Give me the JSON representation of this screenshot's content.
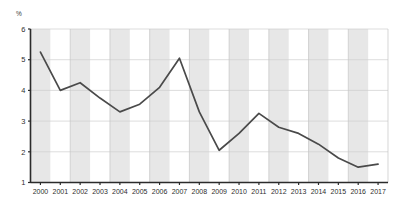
{
  "chart_data": {
    "type": "line",
    "title": "",
    "subtitle": "",
    "xlabel": "",
    "ylabel": "",
    "unit_label": "%",
    "categories": [
      "2000",
      "2001",
      "2002",
      "2003",
      "2004",
      "2005",
      "2006",
      "2007",
      "2008",
      "2009",
      "2010",
      "2011",
      "2012",
      "2013",
      "2014",
      "2015",
      "2016",
      "2017"
    ],
    "values": [
      5.25,
      4.0,
      4.25,
      3.75,
      3.3,
      3.55,
      4.1,
      5.05,
      3.3,
      2.05,
      2.6,
      3.25,
      2.8,
      2.6,
      2.25,
      1.8,
      1.5,
      1.6
    ],
    "series": [
      {
        "name": "",
        "values": [
          5.25,
          4.0,
          4.25,
          3.75,
          3.3,
          3.55,
          4.1,
          5.05,
          3.3,
          2.05,
          2.6,
          3.25,
          2.8,
          2.6,
          2.25,
          1.8,
          1.5,
          1.6
        ]
      }
    ],
    "ytick_labels": [
      "1",
      "2",
      "3",
      "4",
      "5",
      "6"
    ],
    "ytick_values": [
      1,
      2,
      3,
      4,
      5,
      6
    ],
    "ylim": [
      1,
      6
    ],
    "xlim": [
      2000,
      2017
    ],
    "grid": true,
    "legend": false,
    "legend_position": "none",
    "banded_background": true,
    "band_years": [
      "2000",
      "2002",
      "2004",
      "2006",
      "2008",
      "2010",
      "2012",
      "2014",
      "2016"
    ],
    "colors": {
      "line": "#4a4a4a",
      "band": "#e3e3e3",
      "grid": "#cfcfcf",
      "axis": "#2b2b2b",
      "background": "#ffffff",
      "text": "#2e2e2e"
    }
  }
}
